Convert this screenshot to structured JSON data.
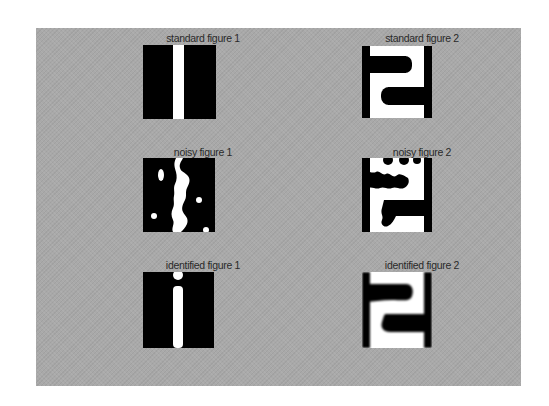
{
  "figure": {
    "background_color": "#a9a9a9",
    "page_color": "#ffffff",
    "foreground_black": "#000000",
    "foreground_white": "#ffffff"
  },
  "rows": [
    {
      "name": "standard",
      "cells": [
        {
          "label": "standard figure 1",
          "left": 107,
          "top": 4,
          "img_left": 143,
          "img_top": 45,
          "w": 73,
          "h": 74,
          "shape": "stripe"
        },
        {
          "label": "standard figure 2",
          "left": 326,
          "top": 4,
          "img_left": 362,
          "img_top": 46,
          "w": 70,
          "h": 72,
          "shape": "two"
        }
      ]
    },
    {
      "name": "noisy",
      "cells": [
        {
          "label": "noisy figure 1",
          "left": 107,
          "top": 118,
          "img_left": 143,
          "img_top": 158,
          "w": 72,
          "h": 74,
          "shape": "noisy-stripe"
        },
        {
          "label": "noisy figure 2",
          "left": 326,
          "top": 118,
          "img_left": 362,
          "img_top": 158,
          "w": 70,
          "h": 74,
          "shape": "noisy-two"
        }
      ]
    },
    {
      "name": "identified",
      "cells": [
        {
          "label": "identified figure 1",
          "left": 107,
          "top": 231,
          "img_left": 143,
          "img_top": 272,
          "w": 71,
          "h": 76,
          "shape": "identified-stripe"
        },
        {
          "label": "identified figure 2",
          "left": 326,
          "top": 231,
          "img_left": 362,
          "img_top": 272,
          "w": 70,
          "h": 76,
          "shape": "identified-two"
        }
      ]
    }
  ]
}
